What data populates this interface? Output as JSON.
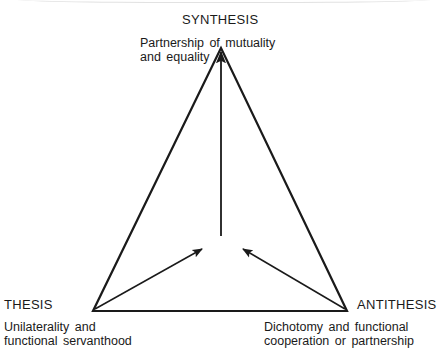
{
  "diagram": {
    "type": "dialectical-triangle",
    "nodes": {
      "synthesis": {
        "heading": "SYNTHESIS",
        "description_line1": "Partnership of mutuality",
        "description_line2": "and equality"
      },
      "thesis": {
        "heading": "THESIS",
        "description_line1": "Unilaterality and",
        "description_line2": "functional servanthood"
      },
      "antithesis": {
        "heading": "ANTITHESIS",
        "description_line1": "Dichotomy and functional",
        "description_line2": "cooperation or partnership"
      }
    },
    "edges": [
      {
        "from": "thesis",
        "to": "synthesis",
        "style": "line"
      },
      {
        "from": "antithesis",
        "to": "synthesis",
        "style": "line"
      },
      {
        "from": "thesis",
        "to": "antithesis",
        "style": "line"
      },
      {
        "from": "thesis",
        "to": "center",
        "style": "arrow"
      },
      {
        "from": "antithesis",
        "to": "center",
        "style": "arrow"
      },
      {
        "from": "center",
        "to": "synthesis",
        "style": "arrow"
      }
    ],
    "stroke_color": "#1a1a1a"
  }
}
